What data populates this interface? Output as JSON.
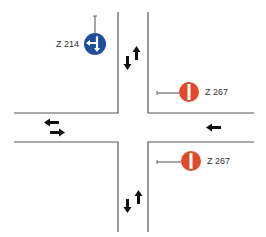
{
  "diagram": {
    "type": "intersection",
    "signs": [
      {
        "code": "Z 214",
        "name": "mandatory-straight-or-left",
        "color": "#1f4e9a",
        "position": "top-left"
      },
      {
        "code": "Z 267",
        "name": "no-entry",
        "color": "#e04a2a",
        "position": "right-upper"
      },
      {
        "code": "Z 267",
        "name": "no-entry",
        "color": "#e04a2a",
        "position": "right-lower"
      }
    ],
    "arrows": [
      {
        "position": "north-arm",
        "directions": [
          "down",
          "up"
        ]
      },
      {
        "position": "south-arm",
        "directions": [
          "down",
          "up"
        ]
      },
      {
        "position": "west-arm",
        "directions": [
          "left",
          "right"
        ]
      },
      {
        "position": "east-arm",
        "directions": [
          "left"
        ]
      }
    ],
    "colors": {
      "road_line": "#555555",
      "arrow": "#111111",
      "pole": "#888888"
    }
  }
}
